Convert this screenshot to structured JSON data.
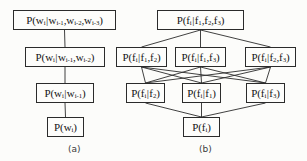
{
  "figure": {
    "width": 307,
    "height": 161,
    "background_color": "#fcfcfa",
    "line_color": "#2b2b2b",
    "text_color": "#151515"
  },
  "panels": [
    {
      "id": "a",
      "caption": "(a)",
      "caption_x": 68,
      "caption_y": 144,
      "nodes": [
        {
          "id": "a0",
          "name": "node-p-wi-given-wi1-wi2-wi3",
          "text": "P(w_i|w_{i-1},w_{i-2},w_{i-3})",
          "x": 13,
          "y": 10,
          "w": 103,
          "h": 20,
          "font_size": 11
        },
        {
          "id": "a1",
          "name": "node-p-wi-given-wi1-wi2",
          "text": "P(w_i|w_{i-1},w_{i-2})",
          "x": 25,
          "y": 47,
          "w": 80,
          "h": 20,
          "font_size": 11
        },
        {
          "id": "a2",
          "name": "node-p-wi-given-wi1",
          "text": "P(w_i|w_{i-1})",
          "x": 36,
          "y": 83,
          "w": 58,
          "h": 20,
          "font_size": 11
        },
        {
          "id": "a3",
          "name": "node-p-wi",
          "text": "P(w_i)",
          "x": 47,
          "y": 117,
          "w": 37,
          "h": 20,
          "font_size": 11
        }
      ],
      "edges": [
        {
          "from": "a0",
          "to": "a1"
        },
        {
          "from": "a1",
          "to": "a2"
        },
        {
          "from": "a2",
          "to": "a3"
        }
      ]
    },
    {
      "id": "b",
      "caption": "(b)",
      "caption_x": 199,
      "caption_y": 144,
      "nodes": [
        {
          "id": "b0",
          "name": "node-p-fi-given-f1-f2-f3",
          "text": "P(f_i|f_1,f_2,f_3)",
          "x": 157,
          "y": 10,
          "w": 87,
          "h": 20,
          "font_size": 11
        },
        {
          "id": "b1",
          "name": "node-p-fi-given-f1-f2",
          "text": "P(f_i|f_1,f_2)",
          "x": 116,
          "y": 47,
          "w": 51,
          "h": 20,
          "font_size": 11
        },
        {
          "id": "b2",
          "name": "node-p-fi-given-f1-f3",
          "text": "P(f_i|f_1,f_3)",
          "x": 175,
          "y": 47,
          "w": 51,
          "h": 20,
          "font_size": 11
        },
        {
          "id": "b3",
          "name": "node-p-fi-given-f2-f3",
          "text": "P(f_i|f_2,f_3)",
          "x": 245,
          "y": 47,
          "w": 51,
          "h": 20,
          "font_size": 11
        },
        {
          "id": "b4",
          "name": "node-p-fi-given-f2",
          "text": "P(f_i|f_2)",
          "x": 126,
          "y": 83,
          "w": 39,
          "h": 20,
          "font_size": 11
        },
        {
          "id": "b5",
          "name": "node-p-fi-given-f1",
          "text": "P(f_i|f_1)",
          "x": 182,
          "y": 83,
          "w": 39,
          "h": 20,
          "font_size": 11
        },
        {
          "id": "b6",
          "name": "node-p-fi-given-f3",
          "text": "P(f_i|f_3)",
          "x": 246,
          "y": 83,
          "w": 39,
          "h": 20,
          "font_size": 11
        },
        {
          "id": "b7",
          "name": "node-p-fi",
          "text": "P(f_i)",
          "x": 183,
          "y": 117,
          "w": 37,
          "h": 20,
          "font_size": 11
        }
      ],
      "edges": [
        {
          "from": "b0",
          "to": "b1"
        },
        {
          "from": "b0",
          "to": "b2"
        },
        {
          "from": "b0",
          "to": "b3"
        },
        {
          "from": "b1",
          "to": "b4"
        },
        {
          "from": "b1",
          "to": "b5"
        },
        {
          "from": "b1",
          "to": "b6"
        },
        {
          "from": "b2",
          "to": "b4"
        },
        {
          "from": "b2",
          "to": "b5"
        },
        {
          "from": "b2",
          "to": "b6"
        },
        {
          "from": "b3",
          "to": "b4"
        },
        {
          "from": "b3",
          "to": "b5"
        },
        {
          "from": "b3",
          "to": "b6"
        },
        {
          "from": "b4",
          "to": "b7"
        },
        {
          "from": "b5",
          "to": "b7"
        },
        {
          "from": "b6",
          "to": "b7"
        }
      ]
    }
  ]
}
